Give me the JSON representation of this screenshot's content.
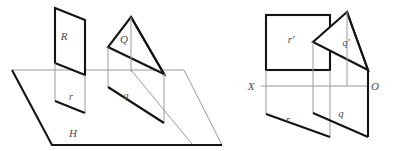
{
  "figure": {
    "type": "descriptive-geometry-projection-diagram",
    "background_color": "#ffffff",
    "stroke_dark": "#111111",
    "stroke_light": "#8c8c8c",
    "label_color": "#4a4a4a",
    "panels": [
      {
        "name": "pictorial-view",
        "description": "Two planes R and Q standing on horizontal plane H with their horizontal traces r and q"
      },
      {
        "name": "orthographic-view",
        "description": "Two-view projection with ground line X-O, frontal traces r-prime and q-prime above, horizontal traces r and q below"
      }
    ],
    "labels": {
      "plane_R": "R",
      "trace_r": "r",
      "plane_Q": "Q",
      "trace_q": "q",
      "plane_H": "H",
      "frontal_r": "r'",
      "frontal_q": "q'",
      "horizontal_r": "r",
      "horizontal_q": "q",
      "axis_left": "X",
      "axis_right": "O"
    }
  },
  "geometry": {
    "left_panel": {
      "ground_plane_H": "12,70 184,70 222,145 52,145",
      "ground_plane_H_dark_edges": "12,70 52,145 222,145",
      "ground_plane_H_light_edges": "12,70 184,70 222,145",
      "plane_R_quad": "55,8 85,20 85,75 55,63",
      "plane_R_vertical_left": "55,63 55,100",
      "plane_R_vertical_right": "85,75 85,112",
      "trace_r_quad": "55,100 85,112 85,112 55,100",
      "trace_r_dark": "55,100 85,112",
      "trace_r_verticals": "55,63 55,100 | 85,75 85,112",
      "plane_Q_triangle": "131,17 108,47 164,74",
      "plane_Q_inner_edge": "108,47 164,74",
      "plane_Q_vertical_apex": "131,17 131,80",
      "plane_Q_vertical_left": "108,47 108,86",
      "plane_Q_vertical_right": "164,74 164,122",
      "trace_q_dark": "108,86 164,122",
      "trace_q_light_diag": "131,70 190,142"
    },
    "right_panel": {
      "axis_line": "262,86 368,86",
      "frontal_r_rect": "266,15 330,15 330,70 266,70",
      "frontal_r_verticals": "266,70 266,136 | 330,70 330,136",
      "horizontal_r_dark": "266,113 330,136",
      "plane_q_prime_apex": "347,12",
      "plane_q_prime_left": "313,42",
      "plane_q_prime_right": "368,70",
      "q_prime_vertical": "347,12 347,86",
      "q_frontal_left_vertical": "313,42 313,86",
      "q_right_vertical": "368,70 368,136",
      "q_horizontal_dark": "313,112 368,136",
      "q_left_vertical_lower": "313,86 313,112"
    }
  },
  "text_items": [
    {
      "id": "label-R",
      "text": "R",
      "x": 64,
      "y": 40
    },
    {
      "id": "label-r-lower",
      "text": "r",
      "x": 71,
      "y": 100
    },
    {
      "id": "label-Q",
      "text": "Q",
      "x": 123,
      "y": 42
    },
    {
      "id": "label-q-lower",
      "text": "q",
      "x": 125,
      "y": 98
    },
    {
      "id": "label-H",
      "text": "H",
      "x": 72,
      "y": 136
    },
    {
      "id": "label-r-prime",
      "text": "r'",
      "x": 290,
      "y": 42
    },
    {
      "id": "label-q-prime",
      "text": "q'",
      "x": 345,
      "y": 45
    },
    {
      "id": "label-r-horiz",
      "text": "r",
      "x": 287,
      "y": 122
    },
    {
      "id": "label-q-horiz",
      "text": "q",
      "x": 340,
      "y": 116
    },
    {
      "id": "label-X",
      "text": "X",
      "x": 250,
      "y": 90
    },
    {
      "id": "label-O",
      "text": "O",
      "x": 372,
      "y": 90
    }
  ]
}
